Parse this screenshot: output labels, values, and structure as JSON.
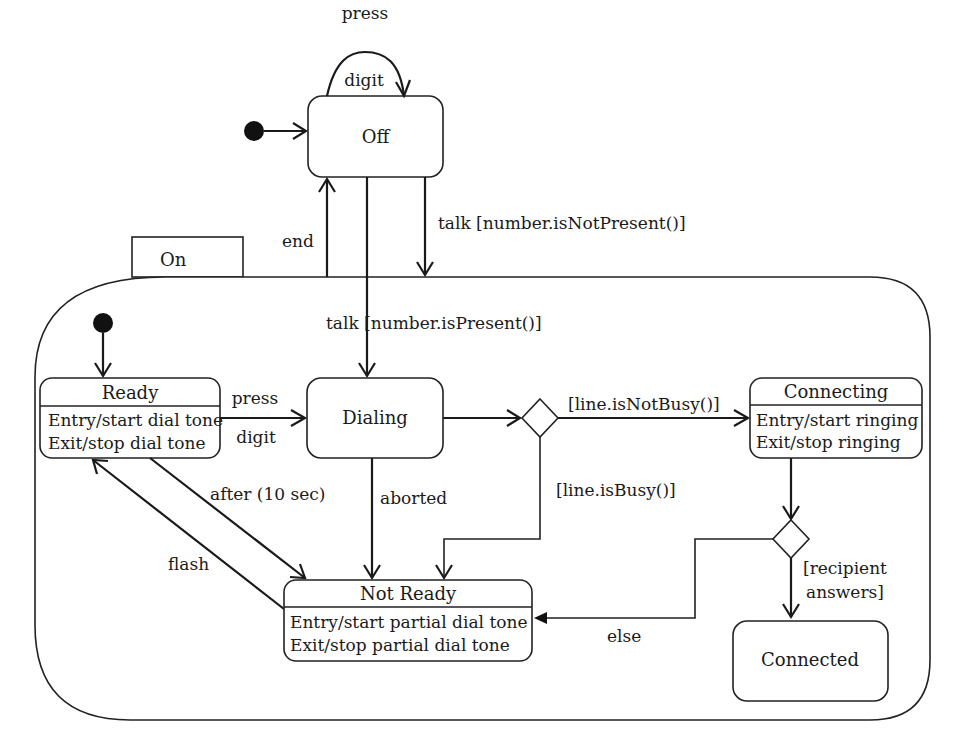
{
  "diagram": {
    "type": "UML state machine",
    "states": {
      "off": {
        "name": "Off"
      },
      "on": {
        "name": "On"
      },
      "ready": {
        "name": "Ready",
        "entry": "Entry/start dial tone",
        "exit": "Exit/stop dial tone"
      },
      "dialing": {
        "name": "Dialing"
      },
      "connecting": {
        "name": "Connecting",
        "entry": "Entry/start ringing",
        "exit": "Exit/stop ringing"
      },
      "not_ready": {
        "name": "Not Ready",
        "entry": "Entry/start partial dial tone",
        "exit": "Exit/stop partial dial tone"
      },
      "connected": {
        "name": "Connected"
      }
    },
    "transitions": {
      "off_self_top": "press",
      "off_self_bottom": "digit",
      "on_to_off": "end",
      "off_to_on": "talk [number.isNotPresent()]",
      "off_to_dialing": "talk [number.isPresent()]",
      "ready_to_dialing_top": "press",
      "ready_to_dialing_bottom": "digit",
      "ready_to_not_ready": "after (10 sec)",
      "not_ready_to_ready": "flash",
      "dialing_to_not_ready": "aborted",
      "choice_to_connecting": "[line.isNotBusy()]",
      "choice_to_not_ready": "[line.isBusy()]",
      "choice2_to_connected_1": "[recipient",
      "choice2_to_connected_2": "answers]",
      "choice2_to_not_ready": "else"
    }
  }
}
